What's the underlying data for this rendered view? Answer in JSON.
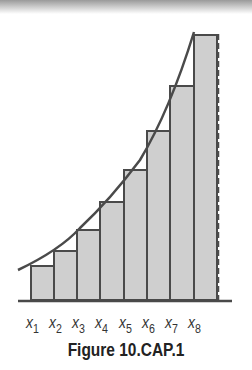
{
  "figure": {
    "caption": "Figure 10.CAP.1",
    "x_labels": [
      {
        "base": "x",
        "sub": "1"
      },
      {
        "base": "x",
        "sub": "2"
      },
      {
        "base": "x",
        "sub": "3"
      },
      {
        "base": "x",
        "sub": "4"
      },
      {
        "base": "x",
        "sub": "5"
      },
      {
        "base": "x",
        "sub": "6"
      },
      {
        "base": "x",
        "sub": "7"
      },
      {
        "base": "x",
        "sub": "8"
      }
    ],
    "colors": {
      "bar_fill": "#cfcfcf",
      "stroke": "#4a4a4a",
      "background": "#ffffff"
    }
  }
}
